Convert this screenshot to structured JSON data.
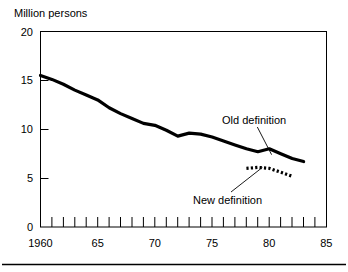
{
  "figure": {
    "name": "unemployment-line-chart",
    "axis_title": "Million persons",
    "bottom_rule": true
  },
  "chart_data": {
    "type": "line",
    "title": "Million persons",
    "xlabel": "",
    "ylabel": "Million persons",
    "xlim": [
      1960,
      1985
    ],
    "ylim": [
      0,
      20
    ],
    "yticks": [
      0,
      5,
      10,
      15,
      20
    ],
    "ytick_labels": [
      "0",
      "5",
      "10",
      "15",
      "20"
    ],
    "xticks": [
      1960,
      1961,
      1962,
      1963,
      1964,
      1965,
      1966,
      1967,
      1968,
      1969,
      1970,
      1971,
      1972,
      1973,
      1974,
      1975,
      1976,
      1977,
      1978,
      1979,
      1980,
      1981,
      1982,
      1983,
      1984,
      1985
    ],
    "xtick_labeled": [
      1960,
      1965,
      1970,
      1975,
      1980,
      1985
    ],
    "xtick_labels": [
      "1960",
      "65",
      "70",
      "75",
      "80",
      "85"
    ],
    "grid": false,
    "legend_position": "inline-annotation",
    "series": [
      {
        "name": "Old definition",
        "style": "solid",
        "x": [
          1960,
          1961,
          1962,
          1963,
          1964,
          1965,
          1966,
          1967,
          1968,
          1969,
          1970,
          1971,
          1972,
          1973,
          1974,
          1975,
          1976,
          1977,
          1978,
          1979,
          1980,
          1981,
          1982,
          1983
        ],
        "values": [
          15.5,
          15.1,
          14.6,
          14.0,
          13.5,
          13.0,
          12.2,
          11.6,
          11.1,
          10.6,
          10.4,
          9.9,
          9.3,
          9.6,
          9.5,
          9.2,
          8.8,
          8.4,
          8.0,
          7.7,
          8.0,
          7.5,
          7.0,
          6.7
        ]
      },
      {
        "name": "New definition",
        "style": "dashed",
        "x": [
          1978,
          1979,
          1980,
          1981,
          1982
        ],
        "values": [
          6.0,
          6.1,
          6.0,
          5.6,
          5.2
        ]
      }
    ],
    "annotations": [
      {
        "text": "Old definition",
        "target_x": 1980.2,
        "target_y": 7.4
      },
      {
        "text": "New definition",
        "target_x": 1979.4,
        "target_y": 6.1
      }
    ]
  }
}
